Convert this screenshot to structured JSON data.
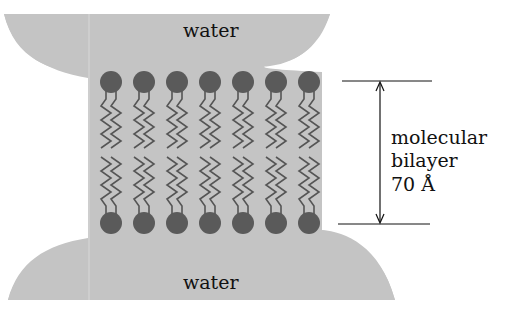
{
  "labels": {
    "water_top": "water",
    "water_bottom": "water",
    "bilayer_line1": "molecular",
    "bilayer_line2": "bilayer",
    "bilayer_thickness": "70 Å"
  },
  "colors": {
    "water": "#c4c4c4",
    "head": "#5a5a5a",
    "tail": "#555555",
    "arrow": "#111111"
  },
  "lipids": {
    "per_row": 7,
    "rows": [
      "top",
      "bottom"
    ]
  }
}
